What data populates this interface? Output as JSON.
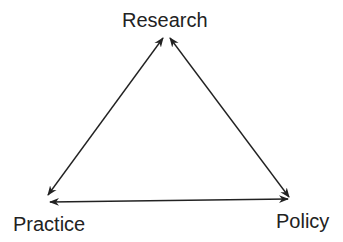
{
  "diagram": {
    "title": "",
    "nodes": [
      {
        "id": "research",
        "label": "Research"
      },
      {
        "id": "practice",
        "label": "Practice"
      },
      {
        "id": "policy",
        "label": "Policy"
      }
    ],
    "edges": [
      {
        "from": "research",
        "to": "practice",
        "direction": "bidirectional"
      },
      {
        "from": "research",
        "to": "policy",
        "direction": "bidirectional"
      },
      {
        "from": "practice",
        "to": "policy",
        "direction": "bidirectional"
      }
    ],
    "colors": {
      "line": "#222222",
      "text": "#222222",
      "background": "#ffffff"
    }
  }
}
